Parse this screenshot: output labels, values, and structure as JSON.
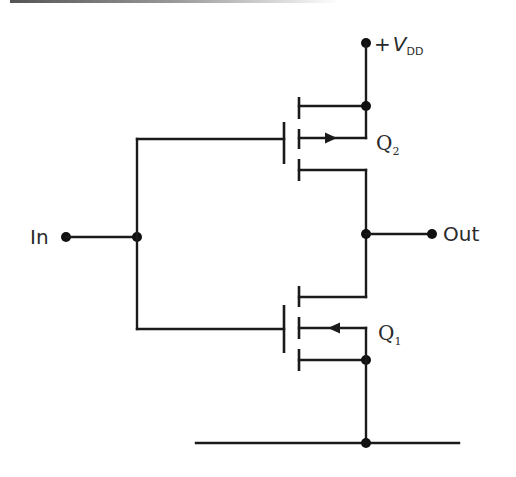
{
  "diagram": {
    "type": "circuit-schematic",
    "labels": {
      "supply_prefix": "+",
      "supply_main": "V",
      "supply_sub": "DD",
      "input": "In",
      "output": "Out",
      "q2_main": "Q",
      "q2_sub": "2",
      "q1_main": "Q",
      "q1_sub": "1"
    },
    "components": [
      {
        "id": "Q2",
        "kind": "p-channel enhancement MOSFET",
        "position": "top",
        "arrow": "out-of-channel (right)"
      },
      {
        "id": "Q1",
        "kind": "n-channel enhancement MOSFET",
        "position": "bottom",
        "arrow": "into-channel (left)"
      }
    ],
    "nets": [
      {
        "name": "VDD",
        "connects": [
          "Q2.source",
          "Q2.body"
        ]
      },
      {
        "name": "In",
        "connects": [
          "Q2.gate",
          "Q1.gate"
        ]
      },
      {
        "name": "Out",
        "connects": [
          "Q2.drain",
          "Q1.drain"
        ]
      },
      {
        "name": "Ground",
        "connects": [
          "Q1.source",
          "Q1.body"
        ]
      }
    ],
    "colors": {
      "line": "#1a1a1a",
      "background": "#ffffff"
    }
  }
}
